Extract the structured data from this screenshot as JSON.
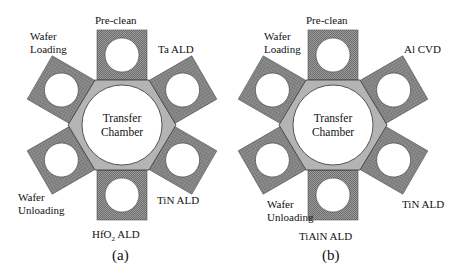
{
  "diagrams": [
    {
      "id": "a",
      "caption": "(a)",
      "center_label_line1": "Transfer",
      "center_label_line2": "Chamber",
      "stations": {
        "top": "Pre-clean",
        "upper_right": "Ta ALD",
        "lower_right": "TiN ALD",
        "bottom_main": "HfO",
        "bottom_sub": "2",
        "bottom_rest": " ALD",
        "lower_left_line1": "Wafer",
        "lower_left_line2": "Unloading",
        "upper_left_line1": "Wafer",
        "upper_left_line2": "Loading"
      }
    },
    {
      "id": "b",
      "caption": "(b)",
      "center_label_line1": "Transfer",
      "center_label_line2": "Chamber",
      "stations": {
        "top": "Pre-clean",
        "upper_right": "Al CVD",
        "lower_right": "TiN ALD",
        "bottom": "TiAlN ALD",
        "lower_left_line1": "Wafer",
        "lower_left_line2": "Unloading",
        "upper_left_line1": "Wafer",
        "upper_left_line2": "Loading"
      }
    }
  ],
  "colors": {
    "chamber_fill": "#8a8a8a",
    "hexagon_fill": "#b4b4b4",
    "outline": "#333333",
    "wafer_fill": "#ffffff"
  }
}
